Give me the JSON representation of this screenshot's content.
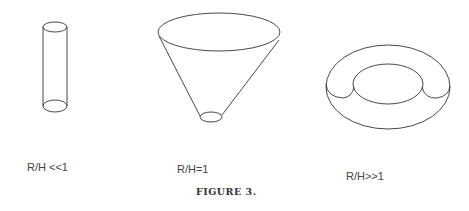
{
  "figure": {
    "caption": "FIGURE 3.",
    "panels": [
      {
        "shape": "cylinder",
        "label": "R/H <<1"
      },
      {
        "shape": "truncated-cone",
        "label": "R/H=1"
      },
      {
        "shape": "torus",
        "label": "R/H>>1"
      }
    ]
  }
}
